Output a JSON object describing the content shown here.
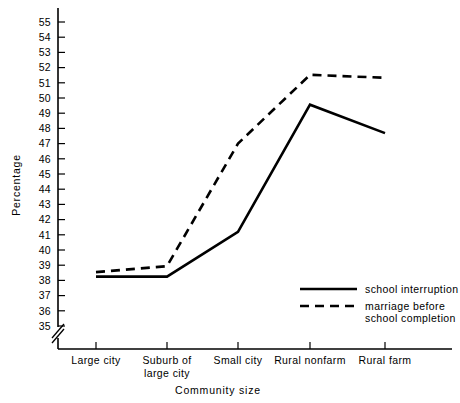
{
  "chart_data": {
    "type": "line",
    "title": "",
    "xlabel": "Community size",
    "ylabel": "Percentage",
    "categories": [
      "Large city",
      "Suburb of large city",
      "Small city",
      "Rural nonfarm",
      "Rural farm"
    ],
    "category_lines": [
      [
        "Large city"
      ],
      [
        "Suburb of",
        "large city"
      ],
      [
        "Small city"
      ],
      [
        "Rural nonfarm"
      ],
      [
        "Rural farm"
      ]
    ],
    "series": [
      {
        "name": "school interruption",
        "style": "solid",
        "values": [
          38.3,
          38.3,
          41.3,
          49.8,
          47.9
        ]
      },
      {
        "name": "marriage before school completion",
        "style": "dashed",
        "values": [
          38.6,
          39.0,
          47.2,
          51.8,
          51.6
        ]
      }
    ],
    "ylim": [
      35,
      55.6
    ],
    "yticks": [
      35,
      36,
      37,
      38,
      39,
      40,
      41,
      42,
      43,
      44,
      45,
      46,
      47,
      48,
      49,
      50,
      51,
      52,
      53,
      54,
      55
    ],
    "ytick_labels": [
      "35",
      "36",
      "37",
      "38",
      "39",
      "40",
      "41",
      "42",
      "43",
      "44",
      "45",
      "46",
      "47",
      "48",
      "49",
      "50",
      "51",
      "52",
      "53",
      "54",
      "55"
    ],
    "axis_break": true,
    "grid": false,
    "legend_position": "bottom-right"
  },
  "legend": {
    "entries": [
      {
        "label": "school interruption",
        "style": "solid",
        "line2": ""
      },
      {
        "label": "marriage before",
        "style": "dashed",
        "line2": "school completion"
      }
    ]
  },
  "colors": {
    "line": "#000000",
    "background": "#ffffff",
    "text": "#000000"
  }
}
